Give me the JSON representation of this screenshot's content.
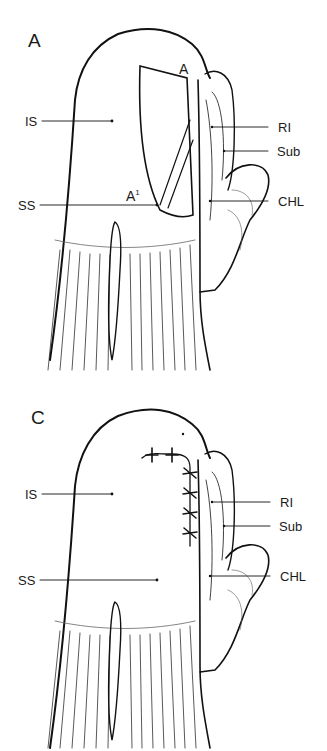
{
  "figure": {
    "panels": [
      {
        "id": "A",
        "letter": "A",
        "labels": {
          "is": "IS",
          "ss": "SS",
          "ri": "RI",
          "sub": "Sub",
          "chl": "CHL",
          "point_a": "A",
          "point_a1_base": "A",
          "point_a1_sup": "1"
        }
      },
      {
        "id": "C",
        "letter": "C",
        "labels": {
          "is": "IS",
          "ss": "SS",
          "ri": "RI",
          "sub": "Sub",
          "chl": "CHL"
        }
      }
    ]
  },
  "colors": {
    "ink": "#111111",
    "background": "#ffffff"
  }
}
